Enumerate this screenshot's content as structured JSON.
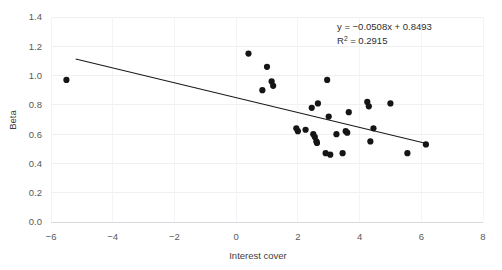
{
  "chart_data": {
    "type": "scatter",
    "title": "",
    "xlabel": "Interest cover",
    "ylabel": "Beta",
    "xlim": [
      -6,
      8
    ],
    "ylim": [
      0.0,
      1.4
    ],
    "xticks": [
      "-6",
      "-4",
      "-2",
      "0",
      "2",
      "4",
      "6",
      "8"
    ],
    "xtick_values": [
      -6,
      -4,
      -2,
      0,
      2,
      4,
      6,
      8
    ],
    "yticks": [
      "0.0",
      "0.2",
      "0.4",
      "0.6",
      "0.8",
      "1.0",
      "1.2",
      "1.4"
    ],
    "ytick_values": [
      0.0,
      0.2,
      0.4,
      0.6,
      0.8,
      1.0,
      1.2,
      1.4
    ],
    "grid": true,
    "grid_axis": "both",
    "legend": "none",
    "marker": "filled-circle",
    "marker_color": "#151515",
    "points": [
      {
        "x": -5.5,
        "y": 0.97
      },
      {
        "x": 0.4,
        "y": 1.15
      },
      {
        "x": 0.85,
        "y": 0.9
      },
      {
        "x": 1.0,
        "y": 1.06
      },
      {
        "x": 1.15,
        "y": 0.96
      },
      {
        "x": 1.2,
        "y": 0.93
      },
      {
        "x": 1.95,
        "y": 0.64
      },
      {
        "x": 2.0,
        "y": 0.62
      },
      {
        "x": 2.25,
        "y": 0.63
      },
      {
        "x": 2.45,
        "y": 0.78
      },
      {
        "x": 2.5,
        "y": 0.6
      },
      {
        "x": 2.55,
        "y": 0.58
      },
      {
        "x": 2.6,
        "y": 0.55
      },
      {
        "x": 2.62,
        "y": 0.54
      },
      {
        "x": 2.65,
        "y": 0.81
      },
      {
        "x": 2.9,
        "y": 0.47
      },
      {
        "x": 2.95,
        "y": 0.97
      },
      {
        "x": 3.0,
        "y": 0.72
      },
      {
        "x": 3.05,
        "y": 0.46
      },
      {
        "x": 3.25,
        "y": 0.6
      },
      {
        "x": 3.45,
        "y": 0.47
      },
      {
        "x": 3.55,
        "y": 0.62
      },
      {
        "x": 3.6,
        "y": 0.61
      },
      {
        "x": 3.65,
        "y": 0.75
      },
      {
        "x": 4.25,
        "y": 0.82
      },
      {
        "x": 4.3,
        "y": 0.79
      },
      {
        "x": 4.35,
        "y": 0.55
      },
      {
        "x": 4.45,
        "y": 0.64
      },
      {
        "x": 5.0,
        "y": 0.81
      },
      {
        "x": 5.55,
        "y": 0.47
      },
      {
        "x": 6.15,
        "y": 0.53
      }
    ],
    "trendline": {
      "slope": -0.0508,
      "intercept": 0.8493,
      "x_start": -5.2,
      "x_end": 6.2,
      "color": "#1a1a1a"
    },
    "annotations": {
      "equation": "y = −0.0508x + 0.8493",
      "r_squared_prefix": "R",
      "r_squared_exponent": "2",
      "r_squared_value": " = 0.2915"
    }
  },
  "colors": {
    "background": "#ffffff",
    "grid": "#eef1f4",
    "axis": "#d7dade",
    "marker": "#151515",
    "text": "#3a3a3a"
  }
}
